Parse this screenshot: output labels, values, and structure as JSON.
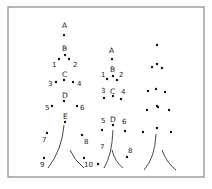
{
  "frame": {
    "x": 8,
    "y": 7,
    "w": 196,
    "h": 170,
    "stroke": "#888888"
  },
  "trees": [
    {
      "name": "tree-1",
      "points": [
        {
          "label": "A",
          "x": 64,
          "y": 35,
          "lx": 62,
          "ly": 28
        },
        {
          "label": "B",
          "x": 65,
          "y": 55,
          "lx": 62,
          "ly": 51
        },
        {
          "label": "1",
          "x": 59,
          "y": 59,
          "lx": 52,
          "ly": 67
        },
        {
          "label": "2",
          "x": 69,
          "y": 59,
          "lx": 73,
          "ly": 67
        },
        {
          "label": "C",
          "x": 64,
          "y": 80,
          "lx": 62,
          "ly": 77
        },
        {
          "label": "3",
          "x": 56,
          "y": 82,
          "lx": 48,
          "ly": 86
        },
        {
          "label": "4",
          "x": 73,
          "y": 82,
          "lx": 77,
          "ly": 86
        },
        {
          "label": "D",
          "x": 64,
          "y": 101,
          "lx": 62,
          "ly": 98
        },
        {
          "label": "5",
          "x": 52,
          "y": 106,
          "lx": 45,
          "ly": 110
        },
        {
          "label": "6",
          "x": 77,
          "y": 106,
          "lx": 80,
          "ly": 110
        },
        {
          "label": "E",
          "x": 65,
          "y": 122,
          "lx": 63,
          "ly": 119
        },
        {
          "label": "7",
          "x": 47,
          "y": 133,
          "lx": 42,
          "ly": 142
        },
        {
          "label": "8",
          "x": 82,
          "y": 135,
          "lx": 84,
          "ly": 144
        },
        {
          "label": "9",
          "x": 44,
          "y": 158,
          "lx": 40,
          "ly": 167
        },
        {
          "label": "10",
          "x": 84,
          "y": 158,
          "lx": 84,
          "ly": 167
        }
      ],
      "trunk": {
        "left": "M64 125 Q62 150 48 168",
        "right": "M70 150 Q74 160 84 168"
      }
    },
    {
      "name": "tree-2",
      "points": [
        {
          "label": "A",
          "x": 112,
          "y": 59,
          "lx": 109,
          "ly": 53
        },
        {
          "label": "B",
          "x": 113,
          "y": 76,
          "lx": 110,
          "ly": 72
        },
        {
          "label": "1",
          "x": 107,
          "y": 79,
          "lx": 101,
          "ly": 77
        },
        {
          "label": "2",
          "x": 117,
          "y": 80,
          "lx": 119,
          "ly": 77
        },
        {
          "label": "C",
          "x": 113,
          "y": 96,
          "lx": 110,
          "ly": 94
        },
        {
          "label": "3",
          "x": 104,
          "y": 98,
          "lx": 101,
          "ly": 93
        },
        {
          "label": "4",
          "x": 121,
          "y": 99,
          "lx": 121,
          "ly": 94
        },
        {
          "label": "D",
          "x": 113,
          "y": 125,
          "lx": 110,
          "ly": 122
        },
        {
          "label": "5",
          "x": 102,
          "y": 130,
          "lx": 101,
          "ly": 123
        },
        {
          "label": "6",
          "x": 125,
          "y": 131,
          "lx": 122,
          "ly": 124
        },
        {
          "label": "7",
          "x": 98,
          "y": 164,
          "lx": 100,
          "ly": 149
        },
        {
          "label": "8",
          "x": 127,
          "y": 157,
          "lx": 128,
          "ly": 153
        }
      ],
      "trunk": {
        "left": "M113 130 Q112 155 104 168",
        "right": "M112 150 Q115 162 123 168"
      }
    },
    {
      "name": "tree-3",
      "points": [
        {
          "label": "",
          "x": 157,
          "y": 45
        },
        {
          "label": "",
          "x": 152,
          "y": 67
        },
        {
          "label": "",
          "x": 157,
          "y": 64
        },
        {
          "label": "",
          "x": 162,
          "y": 68
        },
        {
          "label": "",
          "x": 148,
          "y": 91
        },
        {
          "label": "",
          "x": 156,
          "y": 89
        },
        {
          "label": "",
          "x": 165,
          "y": 92
        },
        {
          "label": "",
          "x": 157,
          "y": 106
        },
        {
          "label": "",
          "x": 147,
          "y": 110
        },
        {
          "label": "",
          "x": 158,
          "y": 107
        },
        {
          "label": "",
          "x": 169,
          "y": 110
        },
        {
          "label": "",
          "x": 143,
          "y": 132
        },
        {
          "label": "",
          "x": 157,
          "y": 128
        },
        {
          "label": "",
          "x": 171,
          "y": 132
        }
      ],
      "trunk": {
        "left": "M156 134 Q155 158 144 170",
        "right": "M162 150 Q166 162 176 170"
      }
    }
  ]
}
